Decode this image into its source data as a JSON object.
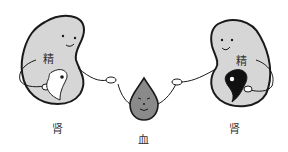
{
  "figure": {
    "left_kidney": {
      "essence_label": "精",
      "organ_label": "肾",
      "yin_yang": "white-dominant"
    },
    "right_kidney": {
      "essence_label": "精",
      "organ_label": "肾",
      "yin_yang": "black-dominant"
    },
    "blood_drop": {
      "label": "血"
    },
    "colors": {
      "kidney_fill": "#d6d6d6",
      "outline": "#1a1a1a",
      "blood_fill": "#8a8a8a",
      "background": "#ffffff"
    }
  }
}
